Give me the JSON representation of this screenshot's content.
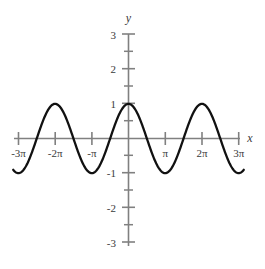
{
  "chart_data": {
    "type": "line",
    "title": "",
    "subtitle": "",
    "xlabel": "x",
    "ylabel": "y",
    "function": "y = cos(x)",
    "xlim": [
      -9.8696,
      9.8696
    ],
    "ylim": [
      -3,
      3
    ],
    "grid": false,
    "legend": false,
    "legend_position": "none",
    "x_tick_labels": [
      "-3π",
      "-2π",
      "-π",
      "π",
      "2π",
      "3π"
    ],
    "x_tick_values": [
      -9.4248,
      -6.2832,
      -3.1416,
      3.1416,
      6.2832,
      9.4248
    ],
    "y_tick_labels": [
      "3",
      "2",
      "1",
      "-1",
      "-2",
      "-3"
    ],
    "y_tick_values": [
      3,
      2,
      1,
      -1,
      -2,
      -3
    ],
    "y_minor_tick_values": [
      2.5,
      1.5,
      0.5,
      -0.5,
      -1.5,
      -2.5
    ],
    "series": [
      {
        "name": "y = cos(x)",
        "amplitude": 1,
        "period": 6.2832,
        "phase": 0,
        "color": "#111111",
        "maxima_x": [
          -6.2832,
          0,
          6.2832
        ],
        "minima_x": [
          -9.4248,
          -3.1416,
          3.1416,
          9.4248
        ],
        "zeros_x": [
          -7.854,
          -4.7124,
          -1.5708,
          1.5708,
          4.7124,
          7.854
        ],
        "points": [
          {
            "x": -9.8696,
            "y": -0.809
          },
          {
            "x": -9.4248,
            "y": -1.0
          },
          {
            "x": -8.6394,
            "y": -0.7071
          },
          {
            "x": -7.854,
            "y": 0.0
          },
          {
            "x": -7.0686,
            "y": 0.7071
          },
          {
            "x": -6.2832,
            "y": 1.0
          },
          {
            "x": -5.4978,
            "y": 0.7071
          },
          {
            "x": -4.7124,
            "y": 0.0
          },
          {
            "x": -3.927,
            "y": -0.7071
          },
          {
            "x": -3.1416,
            "y": -1.0
          },
          {
            "x": -2.3562,
            "y": -0.7071
          },
          {
            "x": -1.5708,
            "y": 0.0
          },
          {
            "x": -0.7854,
            "y": 0.7071
          },
          {
            "x": 0,
            "y": 1.0
          },
          {
            "x": 0.7854,
            "y": 0.7071
          },
          {
            "x": 1.5708,
            "y": 0.0
          },
          {
            "x": 2.3562,
            "y": -0.7071
          },
          {
            "x": 3.1416,
            "y": -1.0
          },
          {
            "x": 3.927,
            "y": -0.7071
          },
          {
            "x": 4.7124,
            "y": 0.0
          },
          {
            "x": 5.4978,
            "y": 0.7071
          },
          {
            "x": 6.2832,
            "y": 1.0
          },
          {
            "x": 7.0686,
            "y": 0.7071
          },
          {
            "x": 7.854,
            "y": 0.0
          },
          {
            "x": 8.6394,
            "y": -0.7071
          },
          {
            "x": 9.4248,
            "y": -1.0
          },
          {
            "x": 9.8696,
            "y": -0.809
          }
        ]
      }
    ],
    "colors": {
      "curve": "#111111",
      "axis": "#808080",
      "tick": "#808080",
      "text": "#3a3a3a",
      "background": "#ffffff"
    }
  }
}
